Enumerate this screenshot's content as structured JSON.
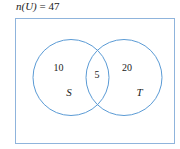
{
  "title": {
    "prefix": "n(U)",
    "equals": " = ",
    "value": "47"
  },
  "diagram": {
    "stroke_color": "#5b9bd5",
    "text_color": "#222222",
    "universe": {
      "label": "U",
      "total": "47"
    },
    "sets": [
      {
        "name": "S",
        "only_count": "10"
      },
      {
        "name": "T",
        "only_count": "20"
      }
    ],
    "intersection": {
      "count": "5"
    }
  }
}
